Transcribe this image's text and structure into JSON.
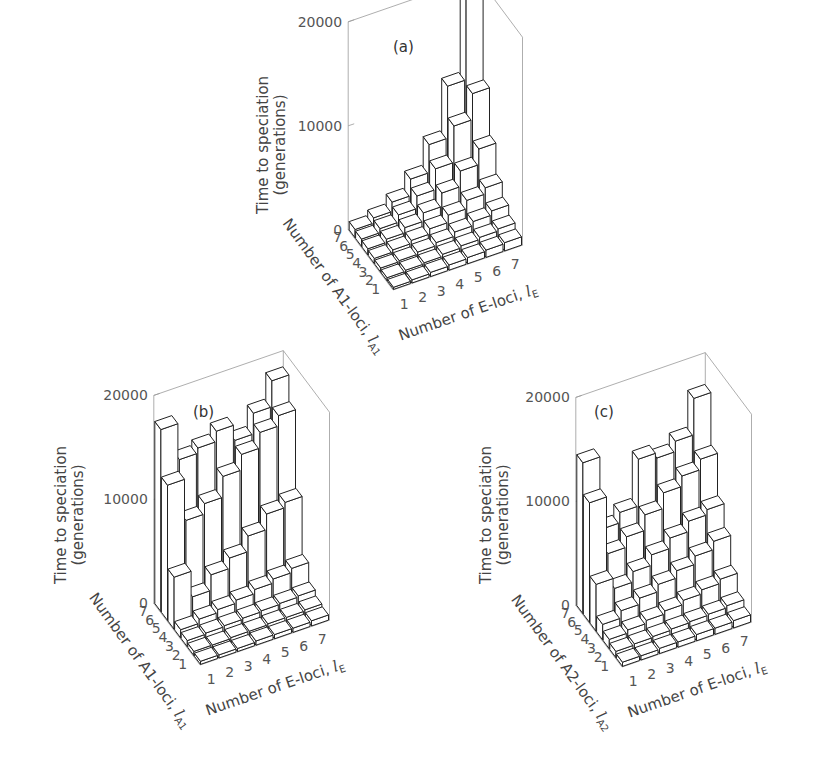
{
  "panels": [
    {
      "id": "a",
      "label": "(a)",
      "ylabel_line1": "Time to speciation",
      "ylabel_line2": "(generations)",
      "yticks": [
        "0",
        "10000",
        "20000"
      ],
      "left_axis_label": "Number of A1-loci,",
      "left_axis_var": "l",
      "left_axis_sub": "A1",
      "right_axis_label": "Number of E-loci,",
      "right_axis_var": "l",
      "right_axis_sub": "E",
      "left_ticks": [
        "1",
        "2",
        "3",
        "4",
        "5",
        "6",
        "7"
      ],
      "right_ticks": [
        "1",
        "2",
        "3",
        "4",
        "5",
        "6",
        "7"
      ]
    },
    {
      "id": "b",
      "label": "(b)",
      "ylabel_line1": "Time to speciation",
      "ylabel_line2": "(generations)",
      "yticks": [
        "0",
        "10000",
        "20000"
      ],
      "left_axis_label": "Number of A1-loci,",
      "left_axis_var": "l",
      "left_axis_sub": "A1",
      "right_axis_label": "Number of E-loci,",
      "right_axis_var": "l",
      "right_axis_sub": "E",
      "left_ticks": [
        "1",
        "2",
        "3",
        "4",
        "5",
        "6",
        "7"
      ],
      "right_ticks": [
        "1",
        "2",
        "3",
        "4",
        "5",
        "6",
        "7"
      ]
    },
    {
      "id": "c",
      "label": "(c)",
      "ylabel_line1": "Time to speciation",
      "ylabel_line2": "(generations)",
      "yticks": [
        "0",
        "10000",
        "20000"
      ],
      "left_axis_label": "Number of A2-loci,",
      "left_axis_var": "l",
      "left_axis_sub": "A2",
      "right_axis_label": "Number of E-loci,",
      "right_axis_var": "l",
      "right_axis_sub": "E",
      "left_ticks": [
        "1",
        "2",
        "3",
        "4",
        "5",
        "6",
        "7"
      ],
      "right_ticks": [
        "1",
        "2",
        "3",
        "4",
        "5",
        "6",
        "7"
      ]
    }
  ],
  "chart_data": [
    {
      "type": "bar3d",
      "title": "(a)",
      "xlabel": "Number of E-loci, lE",
      "ylabel": "Number of A1-loci, lA1",
      "zlabel": "Time to speciation (generations)",
      "zlim": [
        0,
        20000
      ],
      "zticks": [
        0,
        10000,
        20000
      ],
      "x_categories": [
        1,
        2,
        3,
        4,
        5,
        6,
        7
      ],
      "y_categories": [
        1,
        2,
        3,
        4,
        5,
        6,
        7
      ],
      "values_rows_by_A_then_E": [
        [
          200,
          300,
          400,
          500,
          600,
          700,
          800
        ],
        [
          300,
          400,
          500,
          700,
          900,
          1100,
          1300
        ],
        [
          400,
          500,
          700,
          1000,
          1400,
          1800,
          2200
        ],
        [
          500,
          700,
          1000,
          1500,
          2200,
          3000,
          3600
        ],
        [
          600,
          900,
          1400,
          2200,
          3500,
          5000,
          6500
        ],
        [
          700,
          1100,
          1800,
          3000,
          5000,
          8500,
          11000
        ],
        [
          800,
          1300,
          2200,
          3800,
          6500,
          11500,
          20000
        ]
      ]
    },
    {
      "type": "bar3d",
      "title": "(b)",
      "xlabel": "Number of E-loci, lE",
      "ylabel": "Number of A1-loci, lA1",
      "zlabel": "Time to speciation (generations)",
      "zlim": [
        0,
        20000
      ],
      "zticks": [
        0,
        10000,
        20000
      ],
      "x_categories": [
        1,
        2,
        3,
        4,
        5,
        6,
        7
      ],
      "y_categories": [
        1,
        2,
        3,
        4,
        5,
        6,
        7
      ],
      "values_rows_by_A_then_E": [
        [
          300,
          300,
          300,
          400,
          400,
          400,
          500
        ],
        [
          400,
          400,
          500,
          500,
          600,
          600,
          700
        ],
        [
          600,
          700,
          800,
          900,
          1000,
          1100,
          1200
        ],
        [
          800,
          1200,
          1500,
          1800,
          2200,
          2600,
          3000
        ],
        [
          5000,
          2500,
          4000,
          5000,
          6500,
          8000,
          8500
        ],
        [
          13000,
          9000,
          10000,
          12000,
          13500,
          15000,
          16000
        ],
        [
          17500,
          14000,
          14500,
          15500,
          14000,
          16000,
          18500
        ]
      ]
    },
    {
      "type": "bar3d",
      "title": "(c)",
      "xlabel": "Number of E-loci, lE",
      "ylabel": "Number of A2-loci, lA2",
      "zlabel": "Time to speciation (generations)",
      "zlim": [
        0,
        20000
      ],
      "zticks": [
        0,
        10000,
        20000
      ],
      "x_categories": [
        1,
        2,
        3,
        4,
        5,
        6,
        7
      ],
      "y_categories": [
        1,
        2,
        3,
        4,
        5,
        6,
        7
      ],
      "values_rows_by_A_then_E": [
        [
          400,
          400,
          500,
          500,
          600,
          600,
          700
        ],
        [
          600,
          700,
          800,
          900,
          1000,
          1100,
          1300
        ],
        [
          900,
          1200,
          1500,
          1800,
          2200,
          2600,
          3000
        ],
        [
          1500,
          2200,
          2800,
          3500,
          4200,
          5000,
          5800
        ],
        [
          4500,
          3500,
          4500,
          5500,
          6500,
          7500,
          8000
        ],
        [
          11500,
          6000,
          7000,
          8500,
          10000,
          11000,
          12000
        ],
        [
          14500,
          7500,
          8500,
          13000,
          12500,
          13500,
          17000
        ]
      ]
    }
  ]
}
